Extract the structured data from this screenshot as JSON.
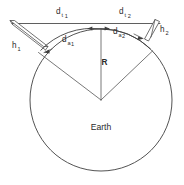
{
  "figure": {
    "background_color": "#ffffff",
    "line_color": "#4d4d4d",
    "text_color": "#2b2b2b"
  },
  "labels": {
    "earth": "Earth",
    "radius": "R",
    "d_t1_base": "d",
    "d_t1_sub": "t",
    "d_t1_sub_index": "1",
    "d_t2_base": "d",
    "d_t2_sub": "t",
    "d_t2_sub_index": "2",
    "d_a1_base": "d",
    "d_a1_sub": "a",
    "d_a1_sub_index": "1",
    "d_a2_base": "d",
    "d_a2_sub": "a",
    "d_a2_sub_index": "2",
    "h1_base": "h",
    "h1_sub": "1",
    "h2_base": "h",
    "h2_sub": "2"
  },
  "geometry": {
    "circle": {
      "cx": 101,
      "cy": 100,
      "r": 71
    },
    "apex": {
      "x": 101,
      "y": 100
    },
    "tangent_line": {
      "x1": 12,
      "y1": 23.5,
      "x2": 160,
      "y2": 23.5
    },
    "left_tangent_point": {
      "x": 44,
      "y": 45
    },
    "right_tangent_point": {
      "x": 146,
      "y": 40
    },
    "top_of_arc": {
      "x": 101,
      "y": 29
    }
  },
  "elements": [
    {
      "name": "earth-circle",
      "kind": "circle"
    },
    {
      "name": "horizon-tangent-line",
      "kind": "line"
    },
    {
      "name": "radius-line",
      "kind": "line"
    },
    {
      "name": "left-radius-line",
      "kind": "line"
    },
    {
      "name": "right-radius-line",
      "kind": "line"
    },
    {
      "name": "antenna-h1-prism",
      "kind": "polygon"
    },
    {
      "name": "antenna-h2-prism",
      "kind": "polygon"
    },
    {
      "name": "d-a1-arc",
      "kind": "arc"
    },
    {
      "name": "d-a2-arc",
      "kind": "arc"
    }
  ]
}
